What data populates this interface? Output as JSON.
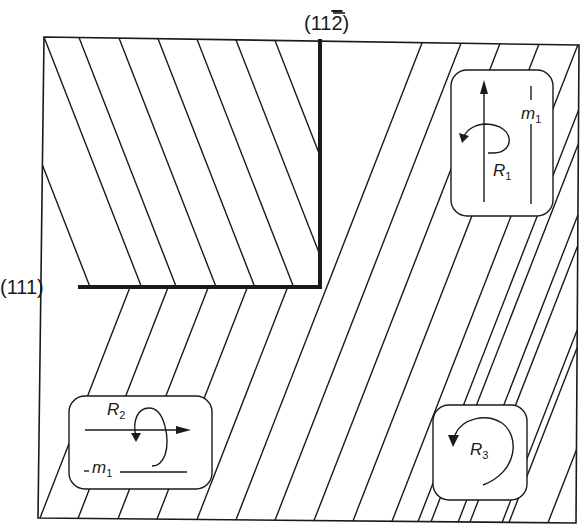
{
  "figure": {
    "width": 584,
    "height": 530,
    "stroke_color": "#1a1a1a",
    "background": "#ffffff",
    "frame": {
      "tl": [
        44,
        37
      ],
      "tr": [
        579,
        45
      ],
      "br": [
        576,
        523
      ],
      "bl": [
        38,
        518
      ]
    },
    "planes": {
      "vertical_boundary": {
        "label_main": "(11",
        "label_bar_digit": "2",
        "label_close": ")",
        "x": 320,
        "y_top": 39,
        "y_bottom": 289,
        "label_x": 304,
        "label_y": 30
      },
      "horizontal_boundary": {
        "label": "(111)",
        "y": 287,
        "x_left": 78,
        "x_right": 321,
        "label_x": 0,
        "label_y": 294
      }
    },
    "hatch_spacing": 39,
    "hatch_slope": 0.39,
    "upper_left_region": {
      "direction": "down-right",
      "top_x_starts": [
        44,
        79,
        119,
        158,
        197,
        236,
        275
      ],
      "left_edge_starts_y": [
        165
      ]
    },
    "right_region": {
      "direction": "up-right",
      "bottom_x_starts": [
        40,
        78,
        118,
        157,
        197,
        236,
        275,
        314,
        353,
        392,
        431,
        470,
        509,
        548
      ]
    }
  },
  "insets": [
    {
      "id": "R1",
      "symbol": "R",
      "subscript": "1",
      "mirror_symbol": "m",
      "mirror_subscript": "1",
      "box": {
        "x": 451,
        "y": 70,
        "w": 102,
        "h": 146
      },
      "axis": "vertical"
    },
    {
      "id": "R2",
      "symbol": "R",
      "subscript": "2",
      "mirror_symbol": "m",
      "mirror_subscript": "1",
      "box": {
        "x": 69,
        "y": 396,
        "w": 143,
        "h": 93
      },
      "axis": "horizontal"
    },
    {
      "id": "R3",
      "symbol": "R",
      "subscript": "3",
      "box": {
        "x": 433,
        "y": 405,
        "w": 94,
        "h": 95
      },
      "axis": "perpendicular"
    }
  ]
}
